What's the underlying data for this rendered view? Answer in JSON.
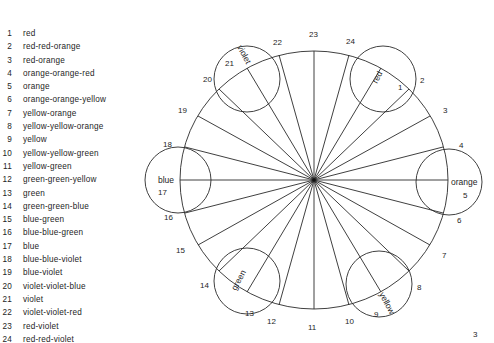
{
  "legend": {
    "items": [
      {
        "num": "1",
        "label": "red"
      },
      {
        "num": "2",
        "label": "red-red-orange"
      },
      {
        "num": "3",
        "label": "red-orange"
      },
      {
        "num": "4",
        "label": "orange-orange-red"
      },
      {
        "num": "5",
        "label": "orange"
      },
      {
        "num": "6",
        "label": "orange-orange-yellow"
      },
      {
        "num": "7",
        "label": "yellow-orange"
      },
      {
        "num": "8",
        "label": "yellow-yellow-orange"
      },
      {
        "num": "9",
        "label": "yellow"
      },
      {
        "num": "10",
        "label": "yellow-yellow-green"
      },
      {
        "num": "11",
        "label": "yellow-green"
      },
      {
        "num": "12",
        "label": "green-green-yellow"
      },
      {
        "num": "13",
        "label": "green"
      },
      {
        "num": "14",
        "label": "green-green-blue"
      },
      {
        "num": "15",
        "label": "blue-green"
      },
      {
        "num": "16",
        "label": "blue-blue-green"
      },
      {
        "num": "17",
        "label": "blue"
      },
      {
        "num": "18",
        "label": "blue-blue-violet"
      },
      {
        "num": "19",
        "label": "blue-violet"
      },
      {
        "num": "20",
        "label": "violet-violet-blue"
      },
      {
        "num": "21",
        "label": "violet"
      },
      {
        "num": "22",
        "label": "violet-violet-red"
      },
      {
        "num": "23",
        "label": "red-violet"
      },
      {
        "num": "24",
        "label": "red-red-violet"
      }
    ]
  },
  "wheel": {
    "center": [
      314,
      180
    ],
    "rx": 134,
    "ry": 129,
    "spoke_count": 24,
    "primary_hues": [
      {
        "name": "red",
        "num": "1"
      },
      {
        "name": "orange",
        "num": "5"
      },
      {
        "name": "yellow",
        "num": "9"
      },
      {
        "name": "green",
        "num": "13"
      },
      {
        "name": "blue",
        "num": "17"
      },
      {
        "name": "violet",
        "num": "21"
      }
    ],
    "rim_numbers": [
      "2",
      "3",
      "4",
      "6",
      "7",
      "8",
      "10",
      "11",
      "12",
      "14",
      "15",
      "16",
      "18",
      "19",
      "20",
      "22",
      "23",
      "24"
    ]
  },
  "page_number": "3"
}
